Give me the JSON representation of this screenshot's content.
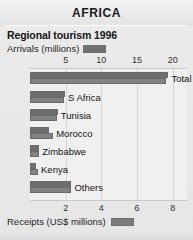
{
  "header": {
    "title": "AFRICA"
  },
  "subtitle": "Regional tourism 1996",
  "legend": {
    "arrivals_label": "Arrivals (millions)",
    "receipts_label": "Receipts (US$ millions)",
    "arrivals_swatch": "arrivals-swatch",
    "receipts_swatch": "receipts-swatch",
    "arrivals_color": "#6e6e6e",
    "receipts_color": "#828282"
  },
  "chart_data": {
    "type": "bar",
    "orientation": "horizontal",
    "title": "Regional tourism 1996",
    "categories": [
      "Total",
      "S Africa",
      "Tunisia",
      "Morocco",
      "Zimbabwe",
      "Kenya",
      "Others"
    ],
    "series": [
      {
        "name": "Arrivals (millions)",
        "values": [
          19.4,
          4.9,
          3.9,
          2.7,
          1.3,
          0.9,
          5.8
        ]
      },
      {
        "name": "Receipts (US$ millions)",
        "values": [
          7.6,
          1.9,
          1.5,
          1.3,
          0.5,
          0.45,
          2.3
        ]
      }
    ],
    "xlabel_top": "Arrivals (millions)",
    "xlabel_bottom": "Receipts (US$ millions)",
    "ylabel": "",
    "xticks_top": [
      5,
      10,
      15,
      20
    ],
    "xticks_bottom": [
      2,
      4,
      6,
      8
    ],
    "xlim_top": [
      0,
      22
    ],
    "xlim_bottom": [
      0,
      8.8
    ],
    "grid": true,
    "legend_position": "top-and-bottom"
  },
  "axis_top": {
    "ticks": [
      "5",
      "10",
      "15",
      "20"
    ]
  },
  "axis_bottom": {
    "ticks": [
      "2",
      "4",
      "6",
      "8"
    ]
  },
  "rows": [
    {
      "label": "Total"
    },
    {
      "label": "S Africa"
    },
    {
      "label": "Tunisia"
    },
    {
      "label": "Morocco"
    },
    {
      "label": "Zimbabwe"
    },
    {
      "label": "Kenya"
    },
    {
      "label": "Others"
    }
  ]
}
